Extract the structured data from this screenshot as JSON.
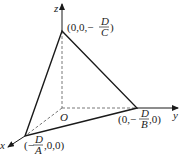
{
  "diagram": {
    "axes": {
      "x_label": "x",
      "y_label": "y",
      "z_label": "z",
      "origin_label": "O"
    },
    "vertices": {
      "z_intercept": {
        "prefix": "(0,0,−",
        "numerator": "D",
        "denominator": "C",
        "suffix": ")"
      },
      "y_intercept": {
        "prefix": "(0,−",
        "numerator": "D",
        "denominator": "B",
        "suffix": ",0)"
      },
      "x_intercept": {
        "prefix": "(−",
        "numerator": "D",
        "denominator": "A",
        "suffix": ",0,0)"
      }
    },
    "colors": {
      "line": "#1a1a1a",
      "dashed": "#555555"
    }
  }
}
